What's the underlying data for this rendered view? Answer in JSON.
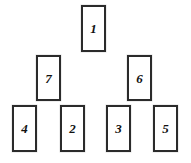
{
  "diagram": {
    "type": "card-pyramid-layout",
    "canvas": {
      "width": 191,
      "height": 163,
      "background": "#ffffff"
    },
    "card_style": {
      "fill": "#ffffff",
      "border_color": "#2b2b2b",
      "border_width": 2,
      "label_color": "#111111"
    },
    "cards": [
      {
        "label": "1",
        "x": 81,
        "y": 5,
        "w": 25,
        "h": 47,
        "row": "top"
      },
      {
        "label": "7",
        "x": 36,
        "y": 55,
        "w": 25,
        "h": 46,
        "row": "middle"
      },
      {
        "label": "6",
        "x": 127,
        "y": 55,
        "w": 25,
        "h": 46,
        "row": "middle"
      },
      {
        "label": "4",
        "x": 12,
        "y": 105,
        "w": 25,
        "h": 47,
        "row": "bottom"
      },
      {
        "label": "2",
        "x": 60,
        "y": 105,
        "w": 25,
        "h": 47,
        "row": "bottom"
      },
      {
        "label": "3",
        "x": 106,
        "y": 105,
        "w": 25,
        "h": 47,
        "row": "bottom"
      },
      {
        "label": "5",
        "x": 153,
        "y": 105,
        "w": 25,
        "h": 47,
        "row": "bottom"
      }
    ]
  }
}
